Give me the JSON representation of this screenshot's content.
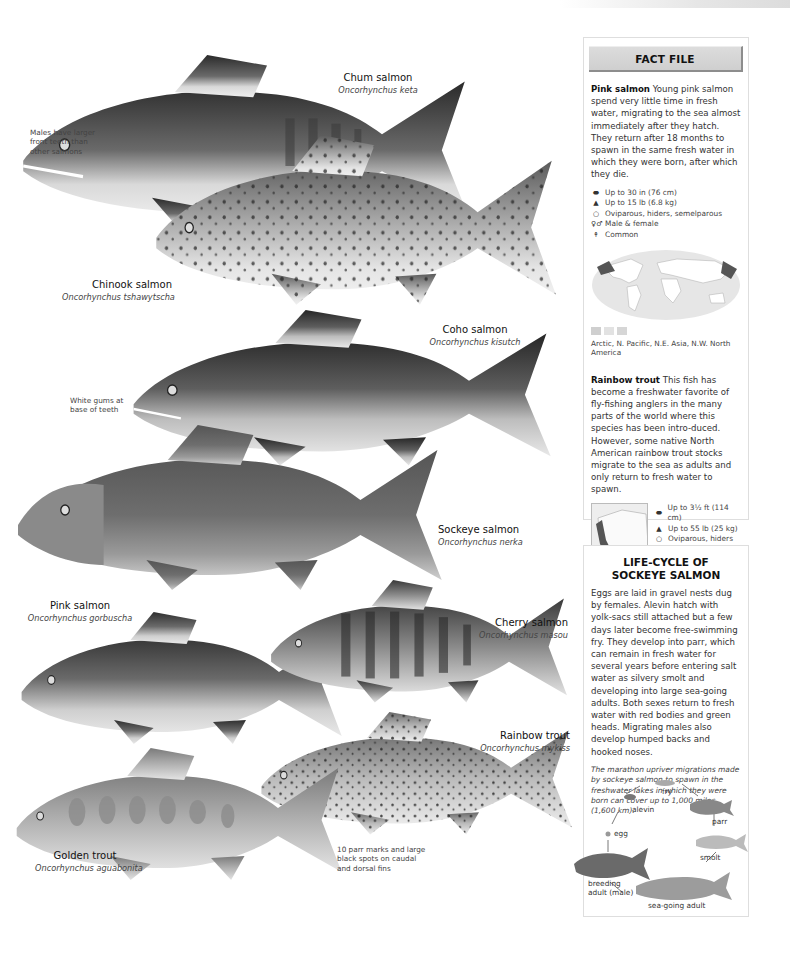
{
  "plate": {
    "species": [
      {
        "id": "chum",
        "common": "Chum salmon",
        "latin": "Oncorhynchus keta"
      },
      {
        "id": "chinook",
        "common": "Chinook salmon",
        "latin": "Oncorhynchus tshawytscha"
      },
      {
        "id": "coho",
        "common": "Coho salmon",
        "latin": "Oncorhynchus kisutch"
      },
      {
        "id": "sockeye",
        "common": "Sockeye salmon",
        "latin": "Oncorhynchus nerka"
      },
      {
        "id": "pink",
        "common": "Pink salmon",
        "latin": "Oncorhynchus gorbuscha"
      },
      {
        "id": "cherry",
        "common": "Cherry salmon",
        "latin": "Oncorhynchus masou"
      },
      {
        "id": "rainbow",
        "common": "Rainbow trout",
        "latin": "Oncorhynchus mykiss"
      },
      {
        "id": "golden",
        "common": "Golden trout",
        "latin": "Oncorhynchus aguabonita"
      }
    ],
    "notes": {
      "chum_teeth": "Males have larger front teeth than other salmons",
      "coho_gums": "White gums at base of teeth",
      "golden_marks": "10 parr marks and large black spots on caudal and dorsal fins"
    }
  },
  "fact_file": {
    "title": "FACT FILE",
    "pink": {
      "name": "Pink salmon",
      "text": "Young pink salmon spend very little time in fresh water, migrating to the sea almost immediately after they hatch. They return after 18 months to spawn in the same fresh water in which they were born, after which they die.",
      "stats": [
        {
          "icon": "length-icon",
          "glyph": "⬬",
          "text": "Up to 30 in (76 cm)"
        },
        {
          "icon": "weight-icon",
          "glyph": "▲",
          "text": "Up to 15 lb (6.8 kg)"
        },
        {
          "icon": "egg-icon",
          "glyph": "○",
          "text": "Oviparous, hiders, semelparous"
        },
        {
          "icon": "sex-icon",
          "glyph": "♀♂",
          "text": "Male & female"
        },
        {
          "icon": "status-icon",
          "glyph": "↟",
          "text": "Common"
        }
      ],
      "range": "Arctic, N. Pacific, N.E. Asia, N.W. North America"
    },
    "rainbow": {
      "name": "Rainbow trout",
      "text": "This fish has become a freshwater favorite of fly-fishing anglers in the many parts of the world where this species has been intro-duced. However, some native North American rainbow trout stocks migrate to the sea as adults and only return to fresh water to spawn.",
      "stats": [
        {
          "icon": "length-icon",
          "glyph": "⬬",
          "text": "Up to 3½ ft (114 cm)"
        },
        {
          "icon": "weight-icon",
          "glyph": "▲",
          "text": "Up to 55 lb (25 kg)"
        },
        {
          "icon": "egg-icon",
          "glyph": "○",
          "text": "Oviparous, hiders"
        },
        {
          "icon": "sex-icon",
          "glyph": "♀♂",
          "text": "Male & female"
        },
        {
          "icon": "status-icon",
          "glyph": "↟",
          "text": "Common"
        }
      ],
      "range": "N.W. North America; introd. widely"
    }
  },
  "life_cycle": {
    "title_line1": "LIFE-CYCLE OF",
    "title_line2": "SOCKEYE SALMON",
    "text": "Eggs are laid in gravel nests dug by females. Alevin hatch with yolk-sacs still attached but a few days later become free-swimming fry. They develop into parr, which can remain in fresh water for several years before entering salt water as silvery smolt and developing into large sea-going adults. Both sexes return to fresh water with red bodies and green heads. Migrating males also develop humped backs and hooked noses.",
    "note": "The marathon upriver migrations made by sockeye salmon to spawn in the freshwater lakes in which they were born can cover up to 1,000 miles (1,600 km).",
    "stages": {
      "fry": "fry",
      "alevin": "alevin",
      "parr": "parr",
      "egg": "egg",
      "smolt": "smolt",
      "breeding_line1": "breeding",
      "breeding_line2": "adult (male)",
      "sea": "sea-going adult"
    }
  },
  "colors": {
    "panel_border": "#dedede",
    "header_bg": "#d4d4d4",
    "header_shadow": "#8d8d8d",
    "text": "#333333"
  }
}
